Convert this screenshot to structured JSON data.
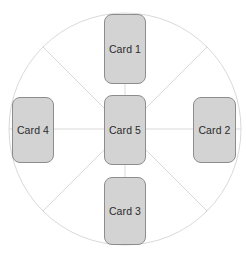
{
  "diagram": {
    "canvas": {
      "width": 246,
      "height": 257,
      "background": "#ffffff"
    },
    "wheel": {
      "name": "spoke-wheel",
      "center_x": 125,
      "center_y": 129,
      "radius": 116,
      "stroke_color": "#d9d9d9",
      "stroke_width": 1,
      "spoke_count": 8,
      "spoke_angles_deg": [
        0,
        45,
        90,
        135,
        180,
        225,
        270,
        315
      ]
    },
    "card_style": {
      "fill": "#d3d3d3",
      "border": "#8d8d8d",
      "text_color": "#2b2b2b",
      "corner_radius": 8
    },
    "cards": [
      {
        "id": "card-1",
        "label": "Card 1",
        "position": "top",
        "x": 104,
        "y": 14,
        "width": 42,
        "height": 70
      },
      {
        "id": "card-2",
        "label": "Card 2",
        "position": "right",
        "x": 193,
        "y": 97,
        "width": 43,
        "height": 66
      },
      {
        "id": "card-3",
        "label": "Card 3",
        "position": "bottom",
        "x": 104,
        "y": 177,
        "width": 42,
        "height": 68
      },
      {
        "id": "card-4",
        "label": "Card 4",
        "position": "left",
        "x": 12,
        "y": 97,
        "width": 42,
        "height": 66
      },
      {
        "id": "card-5",
        "label": "Card 5",
        "position": "center",
        "x": 104,
        "y": 95,
        "width": 42,
        "height": 70
      }
    ]
  }
}
